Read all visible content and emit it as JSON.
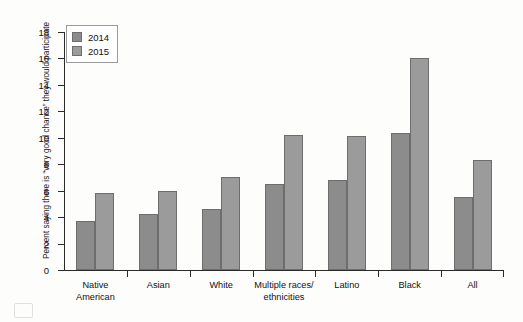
{
  "artifacts": {
    "top_bleed": "                       ",
    "bottom_bleed": "                    "
  },
  "chart_data": {
    "type": "bar",
    "title": "",
    "xlabel": "",
    "ylabel": "Percent saying there is “very good chance” they would participate",
    "ylim": [
      0,
      18
    ],
    "yticks": [
      0,
      2,
      4,
      6,
      8,
      10,
      12,
      14,
      16,
      18
    ],
    "ytick_labels": [
      "0",
      "2",
      "4",
      "6",
      "8",
      "10",
      "12",
      "14",
      "16",
      "18"
    ],
    "grid": false,
    "legend_position": "top-left",
    "categories": [
      "Native American",
      "Asian",
      "White",
      "Multiple races/ethnicities",
      "Latino",
      "Black",
      "All"
    ],
    "category_lines": [
      [
        "Native",
        "American"
      ],
      [
        "Asian"
      ],
      [
        "White"
      ],
      [
        "Multiple races/",
        "ethnicities"
      ],
      [
        "Latino"
      ],
      [
        "Black"
      ],
      [
        "All"
      ]
    ],
    "series": [
      {
        "name": "2014",
        "color": "#8c8c8c",
        "values": [
          3.7,
          4.2,
          4.6,
          6.5,
          6.8,
          10.4,
          5.5
        ]
      },
      {
        "name": "2015",
        "color": "#9b9b9b",
        "values": [
          5.8,
          6.0,
          7.0,
          10.2,
          10.1,
          16.0,
          8.3
        ]
      }
    ]
  }
}
